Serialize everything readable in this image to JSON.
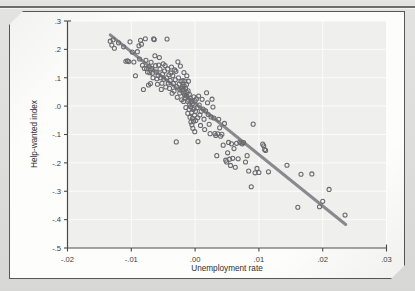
{
  "figure": {
    "background_color": "#fdfdfc",
    "page_color": "#dcdcda",
    "frame_color": "#58585a"
  },
  "chart_data": {
    "type": "scatter",
    "title": "",
    "xlabel": "Unemployment rate",
    "ylabel": "Help-wanted index",
    "xlim": [
      -0.02,
      0.03
    ],
    "ylim": [
      -0.5,
      0.3
    ],
    "xticks": [
      -0.02,
      -0.01,
      0.0,
      0.01,
      0.02,
      0.03
    ],
    "xtick_labels": [
      "-.02",
      "-.01",
      ".00",
      ".01",
      ".02",
      ".03"
    ],
    "yticks": [
      0.3,
      0.2,
      0.1,
      0.0,
      -0.1,
      -0.2,
      -0.3,
      -0.4,
      -0.5
    ],
    "ytick_labels": [
      ".3",
      ".2",
      ".1",
      ".0",
      "-.1",
      "-.2",
      "-.3",
      "-.4",
      "-.5"
    ],
    "grid": true,
    "grid_color": "#ffffff",
    "plot_background": "#efefee",
    "marker_style": "open-circle",
    "marker_color": "#6a6a6e",
    "legend": null,
    "fit_line": {
      "label": "linear fit",
      "color": "#8a8a8e",
      "x": [
        -0.0133,
        0.0236
      ],
      "y": [
        0.251,
        -0.417
      ],
      "slope": -18.1,
      "intercept": 0.0102
    },
    "points": [
      [
        -0.0133,
        0.229
      ],
      [
        -0.01305,
        0.215
      ],
      [
        -0.01285,
        0.2335
      ],
      [
        -0.01265,
        0.204
      ],
      [
        -0.012,
        0.223
      ],
      [
        -0.0112,
        0.209
      ],
      [
        -0.01085,
        0.158
      ],
      [
        -0.0106,
        0.16
      ],
      [
        -0.0104,
        0.157
      ],
      [
        -0.0102,
        0.2265
      ],
      [
        -0.00985,
        0.1905
      ],
      [
        -0.0096,
        0.1555
      ],
      [
        -0.00935,
        0.107
      ],
      [
        -0.00905,
        0.192
      ],
      [
        -0.0088,
        0.2125
      ],
      [
        -0.0087,
        0.166
      ],
      [
        -0.00855,
        0.232
      ],
      [
        -0.0084,
        0.218
      ],
      [
        -0.00825,
        0.144
      ],
      [
        -0.0081,
        0.0585
      ],
      [
        -0.00795,
        0.133
      ],
      [
        -0.0078,
        0.2375
      ],
      [
        -0.0077,
        0.1615
      ],
      [
        -0.0076,
        0.132
      ],
      [
        -0.00745,
        0.1205
      ],
      [
        -0.0073,
        0.0745
      ],
      [
        -0.0072,
        0.1395
      ],
      [
        -0.0071,
        0.118
      ],
      [
        -0.007,
        0.0795
      ],
      [
        -0.0069,
        0.1545
      ],
      [
        -0.0068,
        0.1325
      ],
      [
        -0.0067,
        0.1155
      ],
      [
        -0.0066,
        0.1
      ],
      [
        -0.0065,
        0.237
      ],
      [
        -0.0064,
        0.2345
      ],
      [
        -0.0063,
        0.1775
      ],
      [
        -0.0062,
        0.1425
      ],
      [
        -0.0061,
        0.12
      ],
      [
        -0.006,
        0.0965
      ],
      [
        -0.0059,
        0.077
      ],
      [
        -0.0058,
        0.1075
      ],
      [
        -0.0057,
        0.145
      ],
      [
        -0.0056,
        0.1715
      ],
      [
        -0.0055,
        0.1305
      ],
      [
        -0.0054,
        0.1
      ],
      [
        -0.0053,
        0.059
      ],
      [
        -0.0052,
        0.0805
      ],
      [
        -0.0051,
        0.113
      ],
      [
        -0.005,
        0.149
      ],
      [
        -0.0049,
        0.095
      ],
      [
        -0.0048,
        0.1235
      ],
      [
        -0.0047,
        0.143
      ],
      [
        -0.0046,
        0.0675
      ],
      [
        -0.0045,
        0.1
      ],
      [
        -0.0044,
        0.2365
      ],
      [
        -0.0043,
        0.131
      ],
      [
        -0.0042,
        0.0815
      ],
      [
        -0.0041,
        0.1105
      ],
      [
        -0.004,
        0.0625
      ],
      [
        -0.0039,
        0.0905
      ],
      [
        -0.0038,
        0.117
      ],
      [
        -0.0037,
        0.138
      ],
      [
        -0.0036,
        0.0455
      ],
      [
        -0.0035,
        0.1075
      ],
      [
        -0.0034,
        0.08
      ],
      [
        -0.0033,
        0.053
      ],
      [
        -0.0032,
        0.1275
      ],
      [
        -0.0031,
        0.093
      ],
      [
        -0.003,
        0.1225
      ],
      [
        -0.00295,
        -0.126
      ],
      [
        -0.0029,
        0.069
      ],
      [
        -0.0028,
        0.031
      ],
      [
        -0.0027,
        0.156
      ],
      [
        -0.0026,
        0.1
      ],
      [
        -0.0025,
        0.0775
      ],
      [
        -0.0024,
        0.046
      ],
      [
        -0.0023,
        0.141
      ],
      [
        -0.0022,
        0.0875
      ],
      [
        -0.00215,
        0.064
      ],
      [
        -0.0021,
        0.0225
      ],
      [
        -0.002,
        0.0695
      ],
      [
        -0.00195,
        0.0635
      ],
      [
        -0.0019,
        0.09
      ],
      [
        -0.00185,
        0.059
      ],
      [
        -0.0018,
        0.0165
      ],
      [
        -0.00175,
        0.1185
      ],
      [
        -0.0017,
        0.0705
      ],
      [
        -0.00165,
        0.0395
      ],
      [
        -0.0016,
        0.0885
      ],
      [
        -0.00155,
        0.029
      ],
      [
        -0.0015,
        0.0625
      ],
      [
        -0.00145,
        -0.005
      ],
      [
        -0.0014,
        0.036
      ],
      [
        -0.00135,
        0.0765
      ],
      [
        -0.0013,
        0.107
      ],
      [
        -0.00125,
        0.0475
      ],
      [
        -0.0012,
        0.017
      ],
      [
        -0.00115,
        -0.0255
      ],
      [
        -0.0011,
        0.054
      ],
      [
        -0.00105,
        0.088
      ],
      [
        -0.001,
        0.0215
      ],
      [
        -0.00095,
        -0.012
      ],
      [
        -0.0009,
        0.042
      ],
      [
        -0.00085,
        0.0045
      ],
      [
        -0.0008,
        -0.039
      ],
      [
        -0.00075,
        0.028
      ],
      [
        -0.0007,
        -0.002
      ],
      [
        -0.00065,
        -0.056
      ],
      [
        -0.0006,
        0.016
      ],
      [
        -0.00055,
        -0.0225
      ],
      [
        -0.0005,
        -0.066
      ],
      [
        -0.00045,
        0.008
      ],
      [
        -0.0004,
        -0.043
      ],
      [
        -0.00035,
        -0.078
      ],
      [
        -0.0003,
        -0.012
      ],
      [
        -0.00025,
        -0.053
      ],
      [
        -0.0002,
        0.033
      ],
      [
        -0.00015,
        -0.0065
      ],
      [
        -0.0001,
        -0.032
      ],
      [
        -5e-05,
        -0.09
      ],
      [
        0.0,
        0.0185
      ],
      [
        5e-05,
        -0.018
      ],
      [
        0.0001,
        -0.051
      ],
      [
        0.0002,
        0.0255
      ],
      [
        0.0003,
        -0.006
      ],
      [
        0.0004,
        -0.041
      ],
      [
        0.00045,
        -0.125
      ],
      [
        0.00055,
        0.0355
      ],
      [
        0.00065,
        0.004
      ],
      [
        0.00075,
        -0.031
      ],
      [
        0.00085,
        -0.068
      ],
      [
        0.00095,
        -0.0185
      ],
      [
        0.0011,
        0.024
      ],
      [
        0.00125,
        -0.0105
      ],
      [
        0.0014,
        -0.046
      ],
      [
        0.0015,
        -0.0825
      ],
      [
        0.00165,
        -0.017
      ],
      [
        0.0018,
        0.047
      ],
      [
        0.00195,
        0.012
      ],
      [
        0.00205,
        -0.0295
      ],
      [
        0.0022,
        -0.064
      ],
      [
        0.00235,
        -0.097
      ],
      [
        0.0025,
        -0.038
      ],
      [
        0.00265,
        0.0245
      ],
      [
        0.0028,
        -0.003
      ],
      [
        0.00295,
        -0.042
      ],
      [
        0.0031,
        -0.097
      ],
      [
        0.00325,
        -0.1035
      ],
      [
        0.0034,
        -0.1745
      ],
      [
        0.00355,
        -0.0975
      ],
      [
        0.0037,
        -0.0465
      ],
      [
        0.00385,
        -0.0765
      ],
      [
        0.004,
        -0.106
      ],
      [
        0.0042,
        -0.099
      ],
      [
        0.0044,
        -0.1375
      ],
      [
        0.0046,
        -0.061
      ],
      [
        0.0048,
        -0.1905
      ],
      [
        0.00495,
        -0.1965
      ],
      [
        0.0051,
        -0.1645
      ],
      [
        0.00525,
        -0.128
      ],
      [
        0.0054,
        -0.187
      ],
      [
        0.00555,
        -0.209
      ],
      [
        0.0057,
        -0.133
      ],
      [
        0.0059,
        -0.184
      ],
      [
        0.0061,
        -0.1495
      ],
      [
        0.0063,
        -0.2155
      ],
      [
        0.0065,
        -0.131
      ],
      [
        0.00675,
        -0.1855
      ],
      [
        0.007,
        -0.1265
      ],
      [
        0.0072,
        -0.13
      ],
      [
        0.0074,
        -0.133
      ],
      [
        0.0076,
        -0.1285
      ],
      [
        0.0079,
        -0.197
      ],
      [
        0.00815,
        -0.1745
      ],
      [
        0.0084,
        -0.2285
      ],
      [
        0.0088,
        -0.284
      ],
      [
        0.0091,
        -0.0635
      ],
      [
        0.0094,
        -0.235
      ],
      [
        0.0097,
        -0.2195
      ],
      [
        0.01,
        -0.234
      ],
      [
        0.0106,
        -0.134
      ],
      [
        0.01075,
        -0.1395
      ],
      [
        0.0109,
        -0.153
      ],
      [
        0.01105,
        -0.156
      ],
      [
        0.0115,
        -0.2315
      ],
      [
        0.0144,
        -0.2085
      ],
      [
        0.0161,
        -0.3565
      ],
      [
        0.0166,
        -0.24
      ],
      [
        0.0183,
        -0.239
      ],
      [
        0.0195,
        -0.3545
      ],
      [
        0.02,
        -0.3355
      ],
      [
        0.021,
        -0.2935
      ],
      [
        0.0235,
        -0.384
      ]
    ]
  }
}
